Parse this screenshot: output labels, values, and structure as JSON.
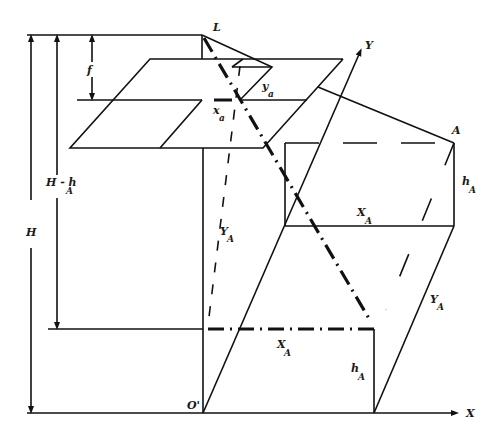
{
  "diagram": {
    "labels": {
      "exposure_station": "L",
      "focal_length": "f",
      "photo_x": "x",
      "photo_x_sub": "a",
      "photo_y": "y",
      "photo_y_sub": "a",
      "ground_y_axis": "Y",
      "point": "A",
      "height_point": "h",
      "height_point_sub": "A",
      "height_point2": "h",
      "height_point2_sub": "A",
      "flying_height": "H",
      "h_minus": "H - h",
      "h_minus_sub": "A",
      "XA_upper": "X",
      "XA_upper_sub": "A",
      "YA_left": "Y",
      "YA_left_sub": "A",
      "XA_lower": "X",
      "XA_lower_sub": "A",
      "YA_right": "Y",
      "YA_right_sub": "A",
      "origin": "O'",
      "ground_x_axis": "X"
    },
    "colors": {
      "line": "#111111",
      "background": "#ffffff"
    }
  }
}
